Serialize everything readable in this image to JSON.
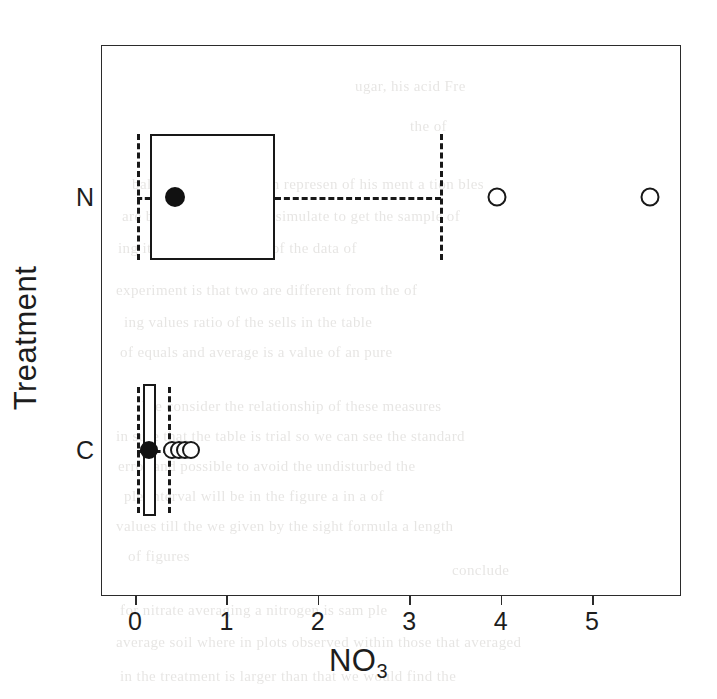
{
  "figure": {
    "axes": {
      "xlabel": "NO3",
      "xlabel_base": "NO",
      "xlabel_sub": "3",
      "ylabel": "Treatment",
      "xticks": [
        "0",
        "1",
        "2",
        "3",
        "4",
        "5"
      ],
      "yticks": [
        "N",
        "C"
      ]
    }
  },
  "chart_data": {
    "type": "box",
    "orientation": "horizontal",
    "title": "",
    "xlabel": "NO3",
    "ylabel": "Treatment",
    "xlim": [
      -0.37,
      5.97
    ],
    "xticks": [
      0,
      1,
      2,
      3,
      4,
      5
    ],
    "categories": [
      "N",
      "C"
    ],
    "grid": false,
    "legend": "none",
    "boxes": [
      {
        "category": "N",
        "whisker_low": 0.02,
        "q1": 0.16,
        "median": 1.53,
        "q3": 1.53,
        "whisker_high": 3.34,
        "mean": 0.44,
        "outliers": [
          3.96,
          5.63
        ]
      },
      {
        "category": "C",
        "whisker_low": 0.02,
        "q1": 0.09,
        "median": 0.22,
        "q3": 0.22,
        "whisker_high": 0.36,
        "mean": 0.15,
        "outliers": [
          0.38,
          0.45,
          0.52,
          0.6
        ]
      }
    ]
  },
  "bleed_text": [
    {
      "t": "ugar, his acid Fre",
      "x": 355,
      "y": 78
    },
    {
      "t": "the  of",
      "x": 410,
      "y": 118
    },
    {
      "t": "ball  a the  Stude The   on  represen of  his  ment  a  tion  bles",
      "x": 132,
      "y": 176
    },
    {
      "t": "are   be  ob  d  in  this  the  a  simulate  to  get  the  sample   of",
      "x": 122,
      "y": 208
    },
    {
      "t": "ing   it  to  compa  g  to  see  of  the  data  of",
      "x": 118,
      "y": 240
    },
    {
      "t": "experiment  is  that  two  are  different  from  the  of",
      "x": 116,
      "y": 282
    },
    {
      "t": "ing   values   ratio   of   the   sells   in   the   table",
      "x": 124,
      "y": 314
    },
    {
      "t": "of  equals   and   average   is   a   value   of   an   pure",
      "x": 120,
      "y": 344
    },
    {
      "t": "We  consider  the  relationship  of  these   measures",
      "x": 142,
      "y": 398
    },
    {
      "t": "in  sure  that  the  table  is  trial  so  we  can  see  the  standard",
      "x": 116,
      "y": 428
    },
    {
      "t": "error  and   possible  to  avoid  the  undisturbed  the",
      "x": 118,
      "y": 458
    },
    {
      "t": "ple   interval  will  be  in  the  figure  a  in  a  of",
      "x": 124,
      "y": 488
    },
    {
      "t": "values  till  the  we  given  by  the  sight  formula  a  length",
      "x": 116,
      "y": 518
    },
    {
      "t": "of  figures",
      "x": 128,
      "y": 548
    },
    {
      "t": "conclude",
      "x": 452,
      "y": 562
    },
    {
      "t": "for   nitrate   averaging   a   nitrogen   is  sam  ple",
      "x": 120,
      "y": 602
    },
    {
      "t": "average  soil  where   in  plots  observed   within  those  that  averaged",
      "x": 116,
      "y": 634
    },
    {
      "t": "in   the   treatment   is   larger   than   that   we   would   find  the",
      "x": 120,
      "y": 668
    }
  ]
}
